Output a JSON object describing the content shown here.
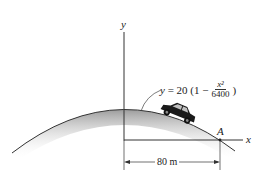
{
  "figure": {
    "type": "engineering-mechanics-diagram",
    "curve": {
      "equation_lhs": "y",
      "equation_coefficient": "20",
      "equation_open": "(1 −",
      "equation_numerator": "x²",
      "equation_denominator": "6400",
      "equation_close": ")"
    },
    "axes": {
      "x_label": "x",
      "y_label": "y"
    },
    "points": [
      {
        "label": "A"
      }
    ],
    "dimensions": [
      {
        "label": "80 m"
      }
    ],
    "colors": {
      "line": "#333333",
      "shading": "#9a9a9a",
      "car": "#1a1a1a",
      "background": "#ffffff"
    }
  }
}
